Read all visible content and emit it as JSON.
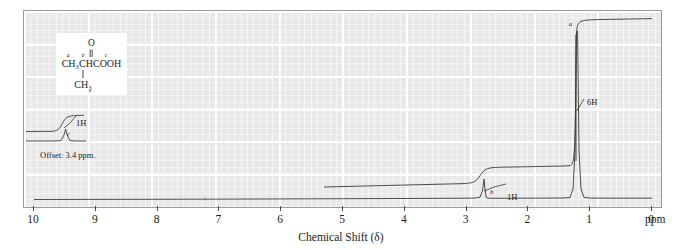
{
  "spectrum": {
    "kind": "1H NMR spectrum",
    "axis_title": "Chemical Shift (δ)",
    "unit_label": "ppm",
    "tick_labels": [
      "10",
      "9",
      "8",
      "7",
      "6",
      "5",
      "4",
      "3",
      "2",
      "1",
      "0"
    ],
    "offset_note": "Offset: 3.4 ppm.",
    "background_color": "#e8e8e8",
    "grid_color": "#ffffff",
    "trace_color": "#3a3a3a"
  },
  "structure": {
    "name": "isobutyric-acid",
    "carbonyl_o": "O",
    "main_chain": "CH₃CHCOOH",
    "branch": "CH₃",
    "label_a": "a",
    "label_b": "b",
    "label_c": "c"
  },
  "annotations": [
    {
      "id": "c-integral",
      "proton_label": "c",
      "integral": "1H"
    },
    {
      "id": "b-integral",
      "proton_label": "b",
      "integral": "1H"
    },
    {
      "id": "a-integral",
      "proton_label": "a",
      "integral": "6H"
    }
  ],
  "labels": {
    "one_h_c": "1H",
    "c": "c",
    "one_h_b": "1H",
    "b": "b",
    "six_h": "6H",
    "a": "a"
  },
  "chart_data": {
    "type": "line",
    "title": "",
    "xlabel": "Chemical Shift (δ)",
    "ylabel": "",
    "xlim": [
      10,
      0
    ],
    "ylim": [
      0,
      1
    ],
    "grid": true,
    "legend": "none",
    "xticks": [
      10,
      9,
      8,
      7,
      6,
      5,
      4,
      3,
      2,
      1,
      0
    ],
    "peaks": [
      {
        "assignment": "a",
        "shift_ppm": 1.2,
        "multiplicity": "doublet",
        "integration_H": 6,
        "rel_height": 0.97
      },
      {
        "assignment": "b",
        "shift_ppm": 2.6,
        "multiplicity": "septet",
        "integration_H": 1,
        "rel_height": 0.2
      },
      {
        "assignment": "c",
        "shift_ppm": 12.0,
        "multiplicity": "singlet",
        "integration_H": 1,
        "rel_height": 0.1,
        "note": "shown in offset trace, Offset: 3.4 ppm."
      }
    ],
    "integral_steps": [
      {
        "assignment": "c",
        "value_H": 1,
        "region": "offset-inset"
      },
      {
        "assignment": "b",
        "value_H": 1,
        "shift_ppm": 2.6
      },
      {
        "assignment": "a",
        "value_H": 6,
        "shift_ppm": 1.2
      }
    ]
  }
}
